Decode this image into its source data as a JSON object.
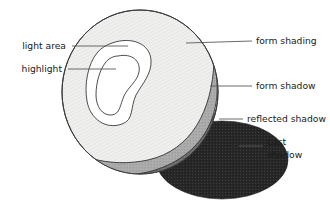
{
  "figure": {
    "background_color": "#ffffff",
    "labels": {
      "light_area": "light area",
      "highlight": "highlight",
      "form_shading": "form shading",
      "form_shadow": "form shadow",
      "reflected_shadow": "reflected shadow",
      "cast_shadow_line1": "cast",
      "cast_shadow_line2": "shadow"
    },
    "colors": {
      "light_area_fill": "#ffffff",
      "highlight_fill": "#ffffff",
      "form_shading_fill": "#ececeb",
      "form_shadow_fill": "#a8a8a8",
      "reflected_shadow_fill": "#6e6e6e",
      "cast_shadow_fill": "#2b2b2b",
      "outline": "#3a3a3a",
      "leader_line": "#5a5a5a",
      "text": "#1a1a1a"
    }
  }
}
